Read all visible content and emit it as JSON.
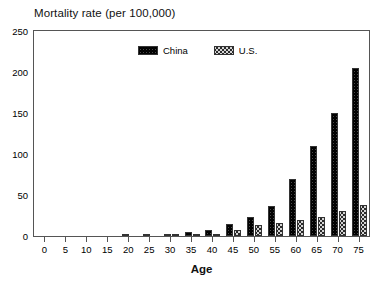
{
  "chart_data": {
    "type": "bar",
    "title": "Mortality rate (per 100,000)",
    "xlabel": "Age",
    "ylabel": "",
    "categories": [
      "0",
      "5",
      "10",
      "15",
      "20",
      "25",
      "30",
      "35",
      "40",
      "45",
      "50",
      "55",
      "60",
      "65",
      "70",
      "75"
    ],
    "series": [
      {
        "name": "China",
        "color": "#4a4a4a",
        "pattern": "dark-crosshatch",
        "values": [
          0,
          0,
          0,
          0,
          0.5,
          1.5,
          3,
          5,
          7,
          15,
          23,
          37,
          70,
          110,
          150,
          180
        ]
      },
      {
        "name": "U.S.",
        "color": "#d4d4d4",
        "pattern": "light-crosshatch",
        "values": [
          0,
          0,
          0,
          0,
          0,
          0.3,
          0.8,
          1.5,
          3,
          7,
          13,
          16,
          20,
          23,
          30,
          38
        ]
      }
    ],
    "extra_last_china_value": 205,
    "ylim": [
      0,
      250
    ],
    "yticks": [
      0,
      50,
      100,
      150,
      200,
      250
    ],
    "xticks": [
      "0",
      "5",
      "10",
      "15",
      "20",
      "25",
      "30",
      "35",
      "40",
      "45",
      "50",
      "55",
      "60",
      "65",
      "70",
      "75"
    ],
    "grid": false,
    "legend_position": "top-center",
    "legend": [
      "China",
      "U.S."
    ]
  },
  "legend": {
    "entries": [
      {
        "label": "China"
      },
      {
        "label": "U.S."
      }
    ]
  },
  "axes": {
    "y_tick_labels": [
      "250",
      "200",
      "150",
      "100",
      "50",
      "0"
    ],
    "x_tick_labels": [
      "0",
      "5",
      "10",
      "15",
      "20",
      "25",
      "30",
      "35",
      "40",
      "45",
      "50",
      "55",
      "60",
      "65",
      "70",
      "75"
    ]
  }
}
